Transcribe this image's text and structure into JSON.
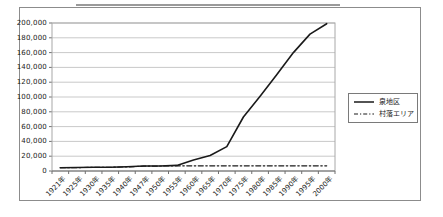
{
  "chart_data": {
    "type": "line",
    "title": "",
    "xlabel": "",
    "ylabel": "",
    "categories": [
      "1921年",
      "1925年",
      "1930年",
      "1935年",
      "1940年",
      "1947年",
      "1950年",
      "1955年",
      "1960年",
      "1965年",
      "1970年",
      "1975年",
      "1980年",
      "1985年",
      "1990年",
      "1995年",
      "2000年"
    ],
    "series": [
      {
        "name": "泉地区",
        "line_style": "solid",
        "color": "#1a1a1a",
        "values": [
          4500,
          4700,
          5000,
          5200,
          5800,
          6800,
          6800,
          7500,
          15000,
          21000,
          33000,
          73000,
          101000,
          130000,
          160000,
          185000,
          199000
        ]
      },
      {
        "name": "村落エリア",
        "line_style": "dash-dot",
        "color": "#1a1a1a",
        "values": [
          4500,
          4600,
          4800,
          5000,
          5500,
          6500,
          6800,
          7000,
          7000,
          7000,
          7000,
          7000,
          7000,
          7000,
          7000,
          7000,
          7000
        ]
      }
    ],
    "ylim": [
      0,
      200000
    ],
    "ytick_step": 20000,
    "ytick_labels": [
      "0",
      "20,000",
      "40,000",
      "60,000",
      "80,000",
      "100,000",
      "120,000",
      "140,000",
      "160,000",
      "180,000",
      "200,000"
    ],
    "grid": true,
    "legend_position": "right"
  },
  "colors": {
    "background": "#ffffff",
    "frame_border": "#8c8c8c",
    "plot_border": "#a8a8a8",
    "gridline": "#c9c9c9",
    "axis": "#707070",
    "text": "#1a1a1a"
  }
}
